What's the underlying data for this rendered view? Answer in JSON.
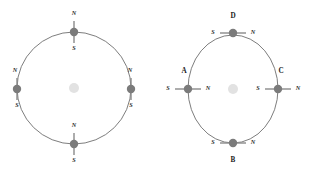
{
  "figure": {
    "background_color": "#ffffff",
    "width": 311,
    "height": 175
  },
  "style": {
    "ring_stroke": "#6e6e6e",
    "magnet_color": "#7b7b7b",
    "magnet_stroke": "#8a8a8a",
    "hub_color": "#e2e2e2",
    "label_color": "#1a1a1a",
    "pole_color": "#2a2a2a"
  },
  "panels": [
    {
      "id": "left-panel",
      "name": "radial-magnet-ring",
      "center": {
        "x": 74,
        "y": 88
      },
      "radius": {
        "x": 57,
        "y": 56
      },
      "hub_radius": 5,
      "magnets": [
        {
          "id": "left-top",
          "name": "magnet-top",
          "angle_deg": 270,
          "orientation": "radial-vertical",
          "x": 74,
          "y": 32,
          "length": 22,
          "dot_radius": 4.2,
          "near_pole": "S",
          "far_pole": "N",
          "labels": [
            {
              "text": "N",
              "x": 74,
              "y": 14
            },
            {
              "text": "S",
              "x": 74,
              "y": 49
            }
          ],
          "name_label": null
        },
        {
          "id": "left-left",
          "name": "magnet-left",
          "angle_deg": 180,
          "orientation": "radial-vertical",
          "x": 17,
          "y": 89,
          "length": 22,
          "dot_radius": 4.2,
          "near_pole": "S",
          "far_pole": "N",
          "labels": [
            {
              "text": "N",
              "x": 15,
              "y": 71
            },
            {
              "text": "S",
              "x": 17,
              "y": 106
            }
          ],
          "name_label": null
        },
        {
          "id": "left-right",
          "name": "magnet-right",
          "angle_deg": 0,
          "orientation": "radial-vertical",
          "x": 131,
          "y": 89,
          "length": 22,
          "dot_radius": 4.2,
          "near_pole": "S",
          "far_pole": "N",
          "labels": [
            {
              "text": "N",
              "x": 130,
              "y": 71
            },
            {
              "text": "S",
              "x": 131,
              "y": 106
            }
          ],
          "name_label": null
        },
        {
          "id": "left-bottom",
          "name": "magnet-bottom",
          "angle_deg": 90,
          "orientation": "radial-vertical",
          "x": 74,
          "y": 144,
          "length": 22,
          "dot_radius": 4.2,
          "near_pole": "N",
          "far_pole": "S",
          "labels": [
            {
              "text": "N",
              "x": 74,
              "y": 126
            },
            {
              "text": "S",
              "x": 74,
              "y": 161
            }
          ],
          "name_label": null
        }
      ]
    },
    {
      "id": "right-panel",
      "name": "tangential-magnet-ring",
      "center": {
        "x": 233,
        "y": 89
      },
      "radius": {
        "x": 45,
        "y": 54
      },
      "hub_radius": 5,
      "magnets": [
        {
          "id": "right-top",
          "name": "magnet-d",
          "angle_deg": 270,
          "orientation": "tangential-horizontal",
          "x": 233,
          "y": 33,
          "length": 26,
          "dot_radius": 4.2,
          "near_pole": "S",
          "far_pole": "N",
          "labels": [
            {
              "text": "S",
              "x": 213,
              "y": 33
            },
            {
              "text": "N",
              "x": 253,
              "y": 33
            }
          ],
          "name_label": {
            "text": "D",
            "x": 233,
            "y": 16
          }
        },
        {
          "id": "right-left",
          "name": "magnet-a",
          "angle_deg": 180,
          "orientation": "tangential-horizontal",
          "x": 188,
          "y": 89,
          "length": 26,
          "dot_radius": 4.2,
          "near_pole": "S",
          "far_pole": "N",
          "labels": [
            {
              "text": "S",
              "x": 168,
              "y": 89
            },
            {
              "text": "N",
              "x": 208,
              "y": 89
            }
          ],
          "name_label": {
            "text": "A",
            "x": 184,
            "y": 71
          }
        },
        {
          "id": "right-right",
          "name": "magnet-c",
          "angle_deg": 0,
          "orientation": "tangential-horizontal",
          "x": 278,
          "y": 89,
          "length": 26,
          "dot_radius": 4.2,
          "near_pole": "S",
          "far_pole": "N",
          "labels": [
            {
              "text": "S",
              "x": 258,
              "y": 89
            },
            {
              "text": "N",
              "x": 298,
              "y": 89
            }
          ],
          "name_label": {
            "text": "C",
            "x": 281,
            "y": 71
          }
        },
        {
          "id": "right-bottom",
          "name": "magnet-b",
          "angle_deg": 90,
          "orientation": "tangential-horizontal",
          "x": 233,
          "y": 143,
          "length": 26,
          "dot_radius": 4.2,
          "near_pole": "S",
          "far_pole": "N",
          "labels": [
            {
              "text": "S",
              "x": 213,
              "y": 143
            },
            {
              "text": "N",
              "x": 253,
              "y": 143
            }
          ],
          "name_label": {
            "text": "B",
            "x": 233,
            "y": 160
          }
        }
      ]
    }
  ]
}
